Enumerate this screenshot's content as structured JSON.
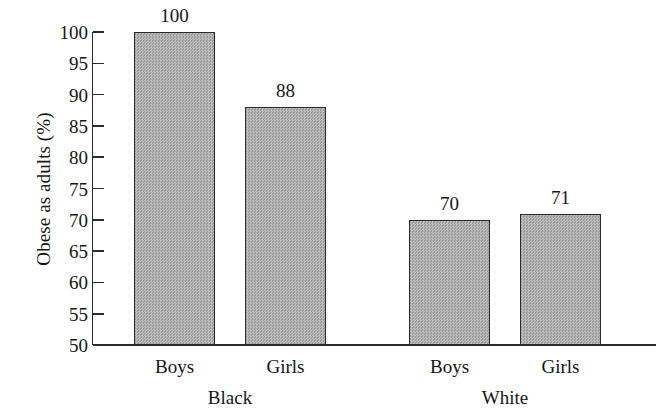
{
  "chart_data": {
    "type": "bar",
    "title": "",
    "subtitle": "",
    "xlabel": "",
    "ylabel": "Obese as adults (%)",
    "ylim": [
      50,
      100
    ],
    "yticks": [
      100,
      95,
      90,
      85,
      80,
      75,
      70,
      65,
      60,
      55,
      50
    ],
    "grid": false,
    "legend": false,
    "categories": [
      "Boys",
      "Girls",
      "Boys",
      "Girls"
    ],
    "groups": [
      {
        "name": "Black",
        "categories": [
          "Boys",
          "Girls"
        ],
        "values": [
          100,
          88
        ]
      },
      {
        "name": "White",
        "categories": [
          "Boys",
          "Girls"
        ],
        "values": [
          70,
          71
        ]
      }
    ],
    "values": [
      100,
      88,
      70,
      71
    ],
    "bar_labels": [
      "100",
      "88",
      "70",
      "71"
    ],
    "group_labels": [
      "Black",
      "White"
    ],
    "colors": {
      "bar_fill": "#a9a9a9",
      "bar_stroke": "#2b2b2b",
      "axis": "#2b2b2b",
      "text": "#161616",
      "background": "#ffffff"
    }
  },
  "axis": {
    "y_title": "Obese as adults (%)",
    "tick_labels": [
      "100",
      "95",
      "90",
      "85",
      "80",
      "75",
      "70",
      "65",
      "60",
      "55",
      "50"
    ]
  },
  "bars": [
    {
      "label": "100",
      "category": "Boys",
      "group": "Black",
      "value": 100
    },
    {
      "label": "88",
      "category": "Girls",
      "group": "Black",
      "value": 88
    },
    {
      "label": "70",
      "category": "Boys",
      "group": "White",
      "value": 70
    },
    {
      "label": "71",
      "category": "Girls",
      "group": "White",
      "value": 71
    }
  ],
  "category_labels": [
    "Boys",
    "Girls",
    "Boys",
    "Girls"
  ],
  "group_labels": [
    "Black",
    "White"
  ]
}
